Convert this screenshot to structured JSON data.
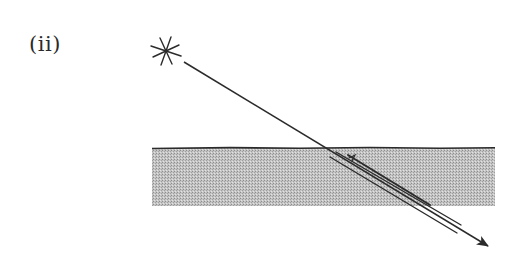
{
  "figure": {
    "label": "(ii)",
    "colors": {
      "ink": "#2b2b2b",
      "medium_fill": "#bdbdbd",
      "medium_dots": "#9a9a9a",
      "background": "#ffffff"
    },
    "source": {
      "icon": "star-light-source-icon",
      "center": [
        166,
        51
      ]
    },
    "medium": {
      "x": 152,
      "y": 148,
      "width": 343,
      "height": 58
    },
    "incident_ray": {
      "from": [
        184,
        62
      ],
      "to": [
        488,
        246
      ],
      "arrowhead": true
    },
    "reflected_rays": [
      {
        "from": [
          336,
          152
        ],
        "to": [
          461,
          225
        ]
      },
      {
        "from": [
          330,
          157
        ],
        "to": [
          457,
          233
        ]
      },
      {
        "from": [
          348,
          155
        ],
        "to": [
          430,
          205
        ]
      }
    ]
  }
}
